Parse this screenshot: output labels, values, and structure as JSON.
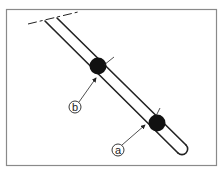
{
  "diagram": {
    "frame_color": "#8a8a8a",
    "line_color": "#222222",
    "ball_color": "#111111",
    "labels": {
      "a": "a",
      "b": "b"
    },
    "markers": [
      {
        "id": "b",
        "label": "b"
      },
      {
        "id": "a",
        "label": "a"
      }
    ]
  }
}
